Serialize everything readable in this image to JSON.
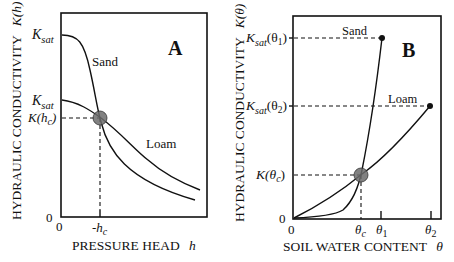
{
  "figure": {
    "panel_a": {
      "label": "A",
      "y_axis_label": "HYDRAULIC CONDUCTIVITY",
      "y_axis_symbol": "K(h)",
      "x_axis_label": "PRESSURE HEAD",
      "x_axis_symbol": "h",
      "y_ticks": {
        "ksat_sand": {
          "base": "K",
          "sub": "sat"
        },
        "ksat_loam": {
          "base": "K",
          "sub": "sat"
        },
        "k_hc": {
          "pre": "K(h",
          "sub": "c",
          "post": ")"
        },
        "zero": "0"
      },
      "x_ticks": {
        "zero": "0",
        "hc": {
          "pre": "-h",
          "sub": "c"
        }
      },
      "curves": {
        "sand": "Sand",
        "loam": "Loam"
      },
      "crossover_marker_color": "#6b6b6b"
    },
    "panel_b": {
      "label": "B",
      "y_axis_label": "HYDRAULIC CONDUCTIVITY",
      "y_axis_symbol": "K(θ)",
      "x_axis_label": "SOIL WATER CONTENT",
      "x_axis_symbol": "θ",
      "y_ticks": {
        "ksat_theta1": {
          "base": "K",
          "sub": "sat",
          "post": "(θ",
          "sub2": "1",
          "end": ")"
        },
        "ksat_theta2": {
          "base": "K",
          "sub": "sat",
          "post": "(θ",
          "sub2": "2",
          "end": ")"
        },
        "k_thetac": {
          "pre": "K(θ",
          "sub": "c",
          "post": ")"
        },
        "zero": "0"
      },
      "x_ticks": {
        "zero": "0",
        "theta_c": {
          "base": "θ",
          "sub": "c"
        },
        "theta_1": {
          "base": "θ",
          "sub": "1"
        },
        "theta_2": {
          "base": "θ",
          "sub": "2"
        }
      },
      "curves": {
        "sand": "Sand",
        "loam": "Loam"
      },
      "crossover_marker_color": "#6b6b6b"
    }
  }
}
